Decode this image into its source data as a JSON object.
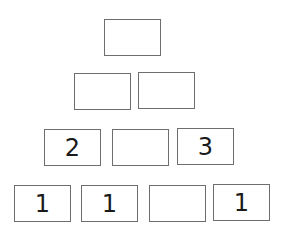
{
  "pyramid": {
    "rows": [
      {
        "cells": [
          ""
        ]
      },
      {
        "cells": [
          "",
          ""
        ]
      },
      {
        "cells": [
          "2",
          "",
          "3"
        ]
      },
      {
        "cells": [
          "1",
          "1",
          "",
          "1"
        ]
      }
    ]
  }
}
